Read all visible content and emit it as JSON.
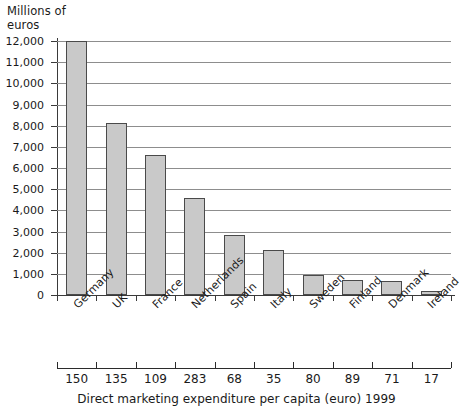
{
  "chart_data": {
    "type": "bar",
    "title": "",
    "ylabel": "Millions of euros",
    "xlabel": "Direct marketing expenditure per capita (euro) 1999",
    "categories": [
      "Germany",
      "UK",
      "France",
      "Netherlands",
      "Spain",
      "Italy",
      "Sweden",
      "Finland",
      "Denmark",
      "Ireland"
    ],
    "values": [
      12000,
      8150,
      6600,
      4600,
      2850,
      2150,
      950,
      700,
      650,
      200
    ],
    "per_capita_label": "Direct marketing expenditure per capita (euro) 1999",
    "per_capita": [
      150,
      135,
      109,
      283,
      68,
      35,
      80,
      89,
      71,
      17
    ],
    "ylim": [
      0,
      12000
    ],
    "ytick_labels": [
      "12,000",
      "11,000",
      "10,000",
      "9,000",
      "8,000",
      "7,000",
      "6,000",
      "5,000",
      "4,000",
      "3,000",
      "2,000",
      "1,000",
      "0"
    ],
    "ytick_values": [
      12000,
      11000,
      10000,
      9000,
      8000,
      7000,
      6000,
      5000,
      4000,
      3000,
      2000,
      1000,
      0
    ],
    "grid": true,
    "legend": "none",
    "bar_color": "#c9c9c9",
    "bar_border_color": "#4a4a4a",
    "gridline_color": "#8d8d8d",
    "axis_color": "#3a3a3a"
  }
}
